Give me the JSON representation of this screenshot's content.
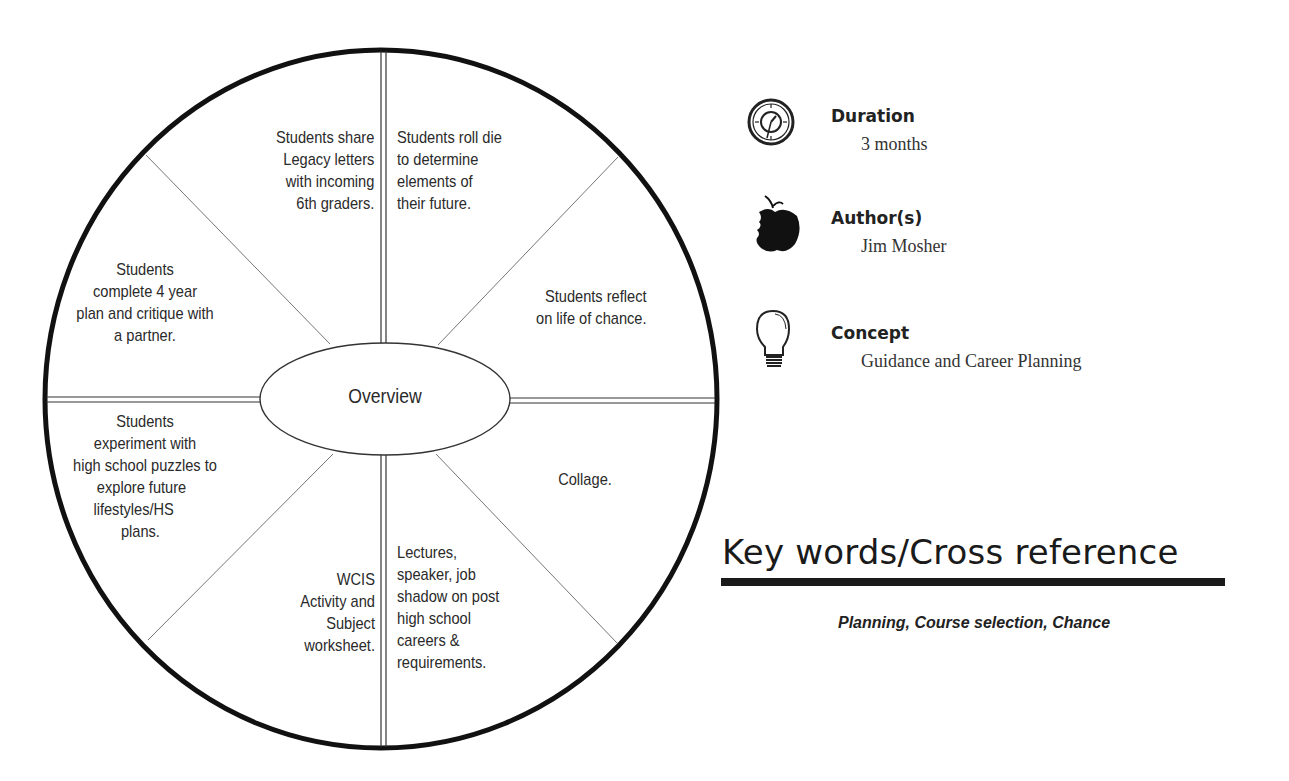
{
  "diagram": {
    "center_label": "Overview",
    "segments": [
      {
        "position": "top-left",
        "lines": [
          "Students share",
          "Legacy letters",
          "with incoming",
          "6th graders."
        ]
      },
      {
        "position": "top-right",
        "lines": [
          "Students roll die",
          "to determine",
          "elements of",
          "their future."
        ]
      },
      {
        "position": "right-upper",
        "lines": [
          "Students reflect",
          "on life of chance."
        ]
      },
      {
        "position": "right-lower",
        "lines": [
          "Collage."
        ]
      },
      {
        "position": "bottom-right",
        "lines": [
          "Lectures,",
          "speaker, job",
          "shadow on post",
          "high school",
          "careers &",
          "requirements."
        ]
      },
      {
        "position": "bottom-left",
        "lines": [
          "WCIS",
          "Activity and",
          "Subject",
          "worksheet."
        ]
      },
      {
        "position": "left-lower",
        "lines": [
          "Students",
          "experiment with",
          "high school puzzles to",
          "explore future",
          "lifestyles/HS",
          "plans."
        ]
      },
      {
        "position": "left-upper",
        "lines": [
          "Students",
          "complete 4 year",
          "plan and critique with",
          "a partner."
        ]
      }
    ]
  },
  "info": {
    "duration": {
      "icon": "clock-icon",
      "label": "Duration",
      "value": "3 months"
    },
    "authors": {
      "icon": "apple-icon",
      "label": "Author(s)",
      "value": "Jim Mosher"
    },
    "concept": {
      "icon": "lightbulb-icon",
      "label": "Concept",
      "value": "Guidance and Career Planning"
    }
  },
  "keywords": {
    "title": "Key words/Cross reference",
    "list": "Planning, Course selection, Chance"
  }
}
